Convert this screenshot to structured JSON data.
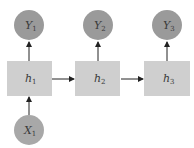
{
  "diagram": {
    "type": "rnn-one-to-many",
    "colors": {
      "background": "#ffffff",
      "output_node": "#9a9a9a",
      "input_node": "#a8a8a8",
      "hidden_box": "#cfcfcf",
      "arrow": "#222222",
      "text": "#3a3a3a"
    },
    "outputs": [
      {
        "base": "Y",
        "sub": "1"
      },
      {
        "base": "Y",
        "sub": "2"
      },
      {
        "base": "Y",
        "sub": "3"
      }
    ],
    "hidden": [
      {
        "base": "h",
        "sub": "1"
      },
      {
        "base": "h",
        "sub": "2"
      },
      {
        "base": "h",
        "sub": "3"
      }
    ],
    "inputs": [
      {
        "base": "X",
        "sub": "1"
      }
    ],
    "edges": [
      {
        "from": "X1",
        "to": "h1"
      },
      {
        "from": "h1",
        "to": "Y1"
      },
      {
        "from": "h2",
        "to": "Y2"
      },
      {
        "from": "h3",
        "to": "Y3"
      },
      {
        "from": "h1",
        "to": "h2"
      },
      {
        "from": "h2",
        "to": "h3"
      }
    ]
  }
}
